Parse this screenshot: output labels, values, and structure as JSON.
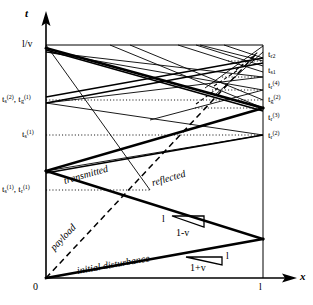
{
  "figure": {
    "type": "spacetime-characteristics-diagram"
  },
  "axes": {
    "x_axis_label": "x",
    "y_axis_label": "t",
    "origin_label": "0",
    "x_max_label": "l",
    "y_max_label": "l/v",
    "x_range": [
      0,
      1
    ],
    "y_range": [
      0,
      1
    ]
  },
  "slope_triangles": [
    {
      "name": "transmitted-slope",
      "rise_label": "l",
      "run_label": "1-v"
    },
    {
      "name": "initial-slope",
      "rise_label": "l",
      "run_label": "1+v"
    }
  ],
  "curve_labels": [
    {
      "name": "initial-disturbance",
      "text": "initial disturbance"
    },
    {
      "name": "payload",
      "text": "payload"
    },
    {
      "name": "transmitted",
      "text": "transmitted"
    },
    {
      "name": "reflected",
      "text": "reflected"
    }
  ],
  "left_tick_labels": [
    {
      "name": "t-top",
      "html": "l/v"
    },
    {
      "name": "t-s2-t-g1",
      "html": "t<sub>s</sub><sup>(2)</sup>, t<sub>g</sub><sup>(1)</sup>"
    },
    {
      "name": "t-s1",
      "html": "t<sub>s</sub><sup>(1)</sup>"
    },
    {
      "name": "t-s1-t-r1",
      "html": "t<sub>s</sub><sup>(1)</sup>, t<sub>r</sub><sup>(1)</sup>"
    }
  ],
  "right_tick_labels": [
    {
      "name": "t-r2-top",
      "html": "t<sub>r2</sub>"
    },
    {
      "name": "t-s1-right",
      "html": "t<sub>s1</sub>"
    },
    {
      "name": "t-r4",
      "html": "t<sub>r</sub><sup>(4)</sup>"
    },
    {
      "name": "t-g2",
      "html": "t<sub>g</sub><sup>(2)</sup>"
    },
    {
      "name": "t-r3",
      "html": "t<sub>r</sub><sup>(3)</sup>"
    },
    {
      "name": "t-r2",
      "html": "t<sub>r</sub><sup>(2)</sup>"
    }
  ],
  "colors": {
    "line": "#000000",
    "background": "#ffffff"
  },
  "chart_data": {
    "type": "line",
    "title": "",
    "xlabel": "x",
    "ylabel": "t",
    "xlim": [
      0,
      1
    ],
    "ylim": [
      0,
      1
    ],
    "grid": false,
    "legend": "none"
  }
}
